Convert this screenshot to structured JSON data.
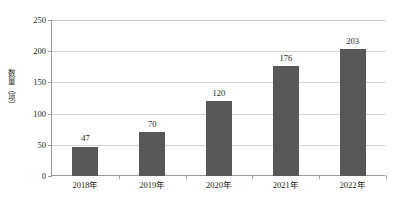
{
  "chart_data": {
    "type": "bar",
    "title": "",
    "subtitle": "",
    "xlabel": "",
    "ylabel": "数量（项）",
    "categories": [
      "2018年",
      "2019年",
      "2020年",
      "2021年",
      "2022年"
    ],
    "values": [
      47,
      70,
      120,
      176,
      203
    ],
    "data_labels": [
      "47",
      "70",
      "120",
      "176",
      "203"
    ],
    "ylim": [
      0,
      250
    ],
    "ytick_values": [
      0,
      50,
      100,
      150,
      200,
      250
    ],
    "ytick_labels": [
      "0",
      "50",
      "100",
      "150",
      "200",
      "250"
    ],
    "grid": "horizontal",
    "legend": "none",
    "bar_color": "#575757",
    "grid_color": "#d3d3d3",
    "axis_color": "#9a9a9a",
    "background_color": "#ffffff",
    "text_color": "#231f20"
  }
}
